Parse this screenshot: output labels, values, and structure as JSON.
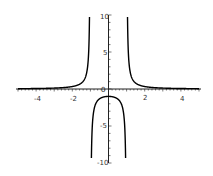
{
  "chart_data": {
    "type": "line",
    "title": "",
    "xlabel": "",
    "ylabel": "",
    "function": "y = 1/(x^2 - 1)",
    "xlim": [
      -5,
      5
    ],
    "ylim": [
      -10,
      10
    ],
    "grid": false,
    "legend": null,
    "x_ticks": [
      -4,
      -2,
      2,
      4
    ],
    "y_ticks": [
      10,
      5,
      -5,
      -10
    ],
    "origin_label": "0",
    "vertical_asymptotes": [
      -1,
      1
    ],
    "series": [
      {
        "name": "f(x)",
        "color": "#000000",
        "points": [
          [
            -5,
            0.042
          ],
          [
            -4,
            0.067
          ],
          [
            -3,
            0.125
          ],
          [
            -2,
            0.333
          ],
          [
            -1.5,
            0.8
          ],
          [
            -1.2,
            2.27
          ],
          [
            -1.1,
            4.76
          ],
          [
            -1.05,
            9.76
          ],
          [
            -0.95,
            -10.26
          ],
          [
            -0.9,
            -5.26
          ],
          [
            -0.8,
            -2.78
          ],
          [
            -0.5,
            -1.33
          ],
          [
            0,
            -1
          ],
          [
            0.5,
            -1.33
          ],
          [
            0.8,
            -2.78
          ],
          [
            0.9,
            -5.26
          ],
          [
            0.95,
            -10.26
          ],
          [
            1.05,
            9.76
          ],
          [
            1.1,
            4.76
          ],
          [
            1.2,
            2.27
          ],
          [
            1.5,
            0.8
          ],
          [
            2,
            0.333
          ],
          [
            3,
            0.125
          ],
          [
            4,
            0.067
          ],
          [
            5,
            0.042
          ]
        ]
      }
    ]
  },
  "labels": {
    "x_neg4": "-4",
    "x_neg2": "-2",
    "x_2": "2",
    "x_4": "4",
    "y_10": "10",
    "y_5": "5",
    "y_neg5": "-5",
    "y_neg10": "-10",
    "origin": "0"
  }
}
